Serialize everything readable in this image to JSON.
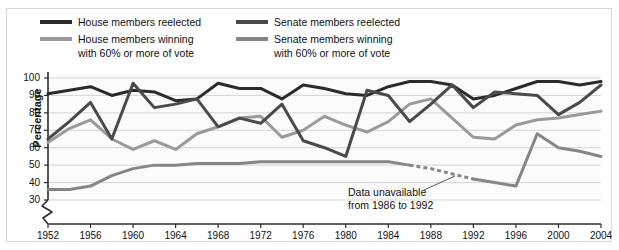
{
  "legend": {
    "items": [
      {
        "label_line1": "House members reelected",
        "label_line2": "",
        "color": "#2b2b2b",
        "name": "house-reelected"
      },
      {
        "label_line1": "House members winning",
        "label_line2": "with 60% or more of vote",
        "color": "#9a9a9a",
        "name": "house-60pct"
      },
      {
        "label_line1": "Senate members reelected",
        "label_line2": "",
        "color": "#4a4a4a",
        "name": "senate-reelected"
      },
      {
        "label_line1": "Senate members winning",
        "label_line2": "with 60% or more of vote",
        "color": "#868686",
        "name": "senate-60pct"
      }
    ]
  },
  "axes": {
    "ylabel": "Percentage",
    "yticks": [
      "100",
      "90",
      "80",
      "70",
      "60",
      "50",
      "40",
      "30"
    ],
    "xticks": [
      "1952",
      "1956",
      "1960",
      "1964",
      "1968",
      "1972",
      "1976",
      "1980",
      "1984",
      "1988",
      "1992",
      "1996",
      "2000",
      "2004"
    ]
  },
  "annotation": {
    "line1": "Data unavailable",
    "line2": "from 1986 to 1992"
  },
  "chart_data": {
    "type": "line",
    "title": "",
    "xlabel": "",
    "ylabel": "Percentage",
    "xlim": [
      1952,
      2004
    ],
    "ylim": [
      30,
      100
    ],
    "grid": true,
    "legend_position": "top",
    "x": [
      1952,
      1954,
      1956,
      1958,
      1960,
      1962,
      1964,
      1966,
      1968,
      1970,
      1972,
      1974,
      1976,
      1978,
      1980,
      1982,
      1984,
      1986,
      1988,
      1990,
      1992,
      1994,
      1996,
      1998,
      2000,
      2002,
      2004
    ],
    "series": [
      {
        "name": "House members reelected",
        "color": "#2b2b2b",
        "values": [
          91,
          93,
          95,
          90,
          93,
          92,
          87,
          88,
          97,
          94,
          94,
          88,
          96,
          94,
          91,
          90,
          95,
          98,
          98,
          96,
          88,
          90,
          94,
          98,
          98,
          96,
          98
        ]
      },
      {
        "name": "House members winning with 60% or more of vote",
        "color": "#9a9a9a",
        "values": [
          63,
          71,
          76,
          65,
          59,
          64,
          59,
          68,
          72,
          77,
          78,
          66,
          70,
          78,
          73,
          69,
          75,
          85,
          88,
          77,
          66,
          65,
          73,
          76,
          77,
          79,
          81
        ]
      },
      {
        "name": "Senate members reelected",
        "color": "#4a4a4a",
        "values": [
          65,
          75,
          86,
          65,
          97,
          83,
          85,
          88,
          72,
          77,
          74,
          85,
          64,
          60,
          55,
          93,
          90,
          75,
          85,
          96,
          83,
          92,
          91,
          90,
          79,
          86,
          96
        ]
      },
      {
        "name": "Senate members winning with 60% or more of vote",
        "color": "#868686",
        "values": [
          36,
          36,
          38,
          44,
          48,
          50,
          50,
          51,
          51,
          51,
          52,
          52,
          52,
          52,
          52,
          52,
          52,
          50,
          48,
          45,
          42,
          40,
          38,
          68,
          60,
          58,
          55
        ],
        "dashed_segment": {
          "from": 1986,
          "to": 1992,
          "note": "Data unavailable from 1986 to 1992"
        }
      }
    ]
  }
}
